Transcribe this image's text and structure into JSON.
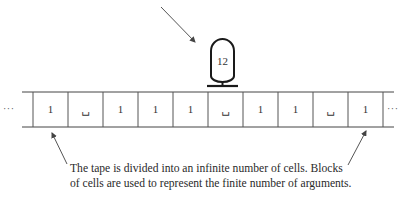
{
  "figure": {
    "type": "turing-machine-tape-diagram",
    "head": {
      "label": "12",
      "position_cell_index": 5
    },
    "tape": {
      "left_ellipsis": "···",
      "right_ellipsis": "···",
      "cells": [
        {
          "symbol": "1"
        },
        {
          "symbol": "␣"
        },
        {
          "symbol": "1"
        },
        {
          "symbol": "1"
        },
        {
          "symbol": "1"
        },
        {
          "symbol": "␣"
        },
        {
          "symbol": "1"
        },
        {
          "symbol": "1"
        },
        {
          "symbol": "␣"
        },
        {
          "symbol": "1"
        }
      ]
    },
    "caption": {
      "line1": "The tape is divided into an infinite number of cells. Blocks",
      "line2": "of cells are used to represent the finite number of arguments."
    },
    "colors": {
      "line": "#333333",
      "head_stroke": "#1a1a1a",
      "text": "#2a2a2a",
      "background": "#ffffff"
    }
  }
}
